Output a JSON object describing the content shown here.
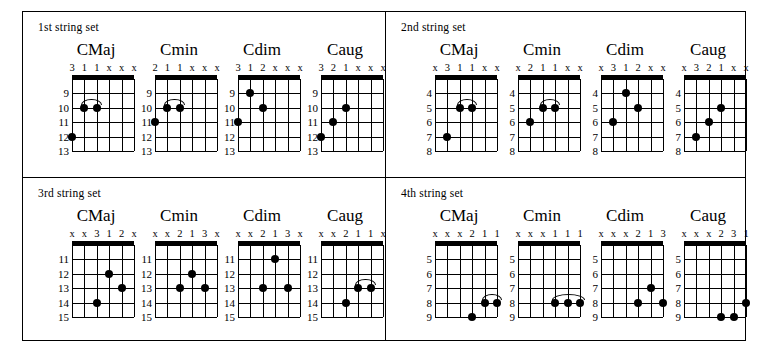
{
  "sets": [
    {
      "label": "1st string set",
      "fret_labels": [
        "9",
        "10",
        "11",
        "12",
        "13"
      ],
      "chords": [
        {
          "name": "CMaj",
          "fingers": [
            "3",
            "1",
            "1",
            "x",
            "x",
            "x"
          ],
          "dots": [
            {
              "string": 1,
              "fret": "10"
            },
            {
              "string": 2,
              "fret": "10"
            },
            {
              "string": 0,
              "fret": "12"
            }
          ],
          "slur": {
            "from": 1,
            "to": 2,
            "fret": "10"
          }
        },
        {
          "name": "Cmin",
          "fingers": [
            "2",
            "1",
            "1",
            "x",
            "x",
            "x"
          ],
          "dots": [
            {
              "string": 1,
              "fret": "10"
            },
            {
              "string": 2,
              "fret": "10"
            },
            {
              "string": 0,
              "fret": "11"
            }
          ],
          "slur": {
            "from": 1,
            "to": 2,
            "fret": "10"
          }
        },
        {
          "name": "Cdim",
          "fingers": [
            "3",
            "1",
            "2",
            "x",
            "x",
            "x"
          ],
          "dots": [
            {
              "string": 1,
              "fret": "9"
            },
            {
              "string": 2,
              "fret": "10"
            },
            {
              "string": 0,
              "fret": "11"
            }
          ],
          "slur": null
        },
        {
          "name": "Caug",
          "fingers": [
            "3",
            "2",
            "1",
            "x",
            "x",
            "x"
          ],
          "dots": [
            {
              "string": 2,
              "fret": "10"
            },
            {
              "string": 1,
              "fret": "11"
            },
            {
              "string": 0,
              "fret": "12"
            }
          ],
          "slur": null
        }
      ]
    },
    {
      "label": "2nd string set",
      "fret_labels": [
        "4",
        "5",
        "6",
        "7",
        "8"
      ],
      "chords": [
        {
          "name": "CMaj",
          "fingers": [
            "x",
            "3",
            "1",
            "1",
            "x",
            "x"
          ],
          "dots": [
            {
              "string": 2,
              "fret": "5"
            },
            {
              "string": 3,
              "fret": "5"
            },
            {
              "string": 1,
              "fret": "7"
            }
          ],
          "slur": {
            "from": 2,
            "to": 3,
            "fret": "5"
          }
        },
        {
          "name": "Cmin",
          "fingers": [
            "x",
            "2",
            "1",
            "1",
            "x",
            "x"
          ],
          "dots": [
            {
              "string": 2,
              "fret": "5"
            },
            {
              "string": 3,
              "fret": "5"
            },
            {
              "string": 1,
              "fret": "6"
            }
          ],
          "slur": {
            "from": 2,
            "to": 3,
            "fret": "5"
          }
        },
        {
          "name": "Cdim",
          "fingers": [
            "x",
            "3",
            "1",
            "2",
            "x",
            "x"
          ],
          "dots": [
            {
              "string": 2,
              "fret": "4"
            },
            {
              "string": 3,
              "fret": "5"
            },
            {
              "string": 1,
              "fret": "6"
            }
          ],
          "slur": null
        },
        {
          "name": "Caug",
          "fingers": [
            "x",
            "3",
            "2",
            "1",
            "x",
            "x"
          ],
          "dots": [
            {
              "string": 3,
              "fret": "5"
            },
            {
              "string": 2,
              "fret": "6"
            },
            {
              "string": 1,
              "fret": "7"
            }
          ],
          "slur": null
        }
      ]
    },
    {
      "label": "3rd string set",
      "fret_labels": [
        "11",
        "12",
        "13",
        "14",
        "15"
      ],
      "chords": [
        {
          "name": "CMaj",
          "fingers": [
            "x",
            "x",
            "3",
            "1",
            "2",
            "x"
          ],
          "dots": [
            {
              "string": 3,
              "fret": "12"
            },
            {
              "string": 4,
              "fret": "13"
            },
            {
              "string": 2,
              "fret": "14"
            }
          ],
          "slur": null
        },
        {
          "name": "Cmin",
          "fingers": [
            "x",
            "x",
            "2",
            "1",
            "3",
            "x"
          ],
          "dots": [
            {
              "string": 3,
              "fret": "12"
            },
            {
              "string": 2,
              "fret": "13"
            },
            {
              "string": 4,
              "fret": "13"
            }
          ],
          "slur": null
        },
        {
          "name": "Cdim",
          "fingers": [
            "x",
            "x",
            "2",
            "1",
            "3",
            "x"
          ],
          "dots": [
            {
              "string": 3,
              "fret": "11"
            },
            {
              "string": 2,
              "fret": "13"
            },
            {
              "string": 4,
              "fret": "13"
            }
          ],
          "slur": null
        },
        {
          "name": "Caug",
          "fingers": [
            "x",
            "x",
            "2",
            "1",
            "1",
            "x"
          ],
          "dots": [
            {
              "string": 3,
              "fret": "13"
            },
            {
              "string": 4,
              "fret": "13"
            },
            {
              "string": 2,
              "fret": "14"
            }
          ],
          "slur": {
            "from": 3,
            "to": 4,
            "fret": "13"
          }
        }
      ]
    },
    {
      "label": "4th string set",
      "fret_labels": [
        "5",
        "6",
        "7",
        "8",
        "9"
      ],
      "chords": [
        {
          "name": "CMaj",
          "fingers": [
            "x",
            "x",
            "x",
            "2",
            "1",
            "1"
          ],
          "dots": [
            {
              "string": 4,
              "fret": "8"
            },
            {
              "string": 5,
              "fret": "8"
            },
            {
              "string": 3,
              "fret": "9"
            }
          ],
          "slur": {
            "from": 4,
            "to": 5,
            "fret": "8"
          }
        },
        {
          "name": "Cmin",
          "fingers": [
            "x",
            "x",
            "x",
            "1",
            "1",
            "1"
          ],
          "dots": [
            {
              "string": 3,
              "fret": "8"
            },
            {
              "string": 4,
              "fret": "8"
            },
            {
              "string": 5,
              "fret": "8"
            }
          ],
          "slur": {
            "from": 3,
            "to": 5,
            "fret": "8"
          }
        },
        {
          "name": "Cdim",
          "fingers": [
            "x",
            "x",
            "x",
            "2",
            "1",
            "3"
          ],
          "dots": [
            {
              "string": 4,
              "fret": "7"
            },
            {
              "string": 3,
              "fret": "8"
            },
            {
              "string": 5,
              "fret": "8"
            }
          ],
          "slur": null
        },
        {
          "name": "Caug",
          "fingers": [
            "x",
            "x",
            "x",
            "2",
            "3",
            "1"
          ],
          "dots": [
            {
              "string": 5,
              "fret": "8"
            },
            {
              "string": 3,
              "fret": "9"
            },
            {
              "string": 4,
              "fret": "9"
            }
          ],
          "slur": null
        }
      ]
    }
  ]
}
